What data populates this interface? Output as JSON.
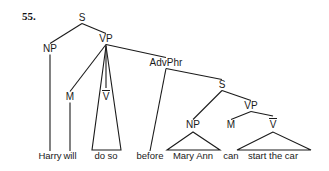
{
  "exercise": {
    "number": "55."
  },
  "tree": {
    "type": "syntax-tree",
    "sentence": "Harry will do so before Mary Ann can start the car",
    "nodes": [
      {
        "id": "S1",
        "label": "S",
        "x": 82,
        "y": 21,
        "kind": "nonterminal"
      },
      {
        "id": "NP1",
        "label": "NP",
        "x": 50,
        "y": 52,
        "kind": "nonterminal"
      },
      {
        "id": "VP1",
        "label": "VP",
        "x": 106,
        "y": 42,
        "kind": "nonterminal"
      },
      {
        "id": "M1",
        "label": "M",
        "x": 70,
        "y": 100,
        "kind": "nonterminal"
      },
      {
        "id": "VBAR1",
        "label": "V",
        "x": 106,
        "y": 100,
        "kind": "vbar"
      },
      {
        "id": "ADVPHR",
        "label": "AdvPhr",
        "x": 166,
        "y": 66,
        "kind": "nonterminal"
      },
      {
        "id": "S2",
        "label": "S",
        "x": 222,
        "y": 88,
        "kind": "nonterminal"
      },
      {
        "id": "NP2",
        "label": "NP",
        "x": 193,
        "y": 128,
        "kind": "nonterminal"
      },
      {
        "id": "VP2",
        "label": "VP",
        "x": 251,
        "y": 109,
        "kind": "nonterminal"
      },
      {
        "id": "M2",
        "label": "M",
        "x": 231,
        "y": 128,
        "kind": "nonterminal"
      },
      {
        "id": "VBAR2",
        "label": "V",
        "x": 273,
        "y": 128,
        "kind": "vbar"
      }
    ],
    "leaves": [
      {
        "id": "L1",
        "label": "Harry",
        "x": 50,
        "y": 159,
        "triangle": false,
        "left": 0,
        "right": 0
      },
      {
        "id": "L2",
        "label": "will",
        "x": 70,
        "y": 159,
        "triangle": false,
        "left": 0,
        "right": 0
      },
      {
        "id": "L3",
        "label": "do so",
        "x": 106,
        "y": 159,
        "triangle": true,
        "left": 92,
        "right": 121
      },
      {
        "id": "L4",
        "label": "before",
        "x": 150,
        "y": 159,
        "triangle": false,
        "left": 0,
        "right": 0
      },
      {
        "id": "L5",
        "label": "Mary Ann",
        "x": 193,
        "y": 159,
        "triangle": true,
        "left": 167,
        "right": 220
      },
      {
        "id": "L6",
        "label": "can",
        "x": 231,
        "y": 159,
        "triangle": false,
        "left": 0,
        "right": 0
      },
      {
        "id": "L7",
        "label": "start the car",
        "x": 273,
        "y": 159,
        "triangle": true,
        "left": 237,
        "right": 311
      }
    ],
    "edges": [
      {
        "from": "S1",
        "to": "NP1"
      },
      {
        "from": "S1",
        "to": "VP1"
      },
      {
        "from": "NP1",
        "to": "L1"
      },
      {
        "from": "VP1",
        "to": "M1"
      },
      {
        "from": "VP1",
        "to": "VBAR1"
      },
      {
        "from": "VP1",
        "to": "ADVPHR"
      },
      {
        "from": "M1",
        "to": "L2"
      },
      {
        "from": "ADVPHR",
        "to": "L4"
      },
      {
        "from": "ADVPHR",
        "to": "S2"
      },
      {
        "from": "S2",
        "to": "NP2"
      },
      {
        "from": "S2",
        "to": "VP2"
      },
      {
        "from": "VP2",
        "to": "M2"
      },
      {
        "from": "VP2",
        "to": "VBAR2"
      }
    ],
    "colors": {
      "stroke": "#1a1a1a",
      "text": "#1a1a1a",
      "background": "#ffffff"
    }
  }
}
